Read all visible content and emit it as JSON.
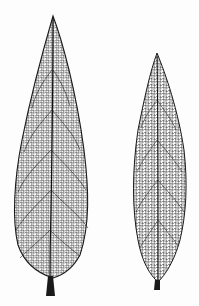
{
  "image": {
    "description": "Engraving-style illustration of two skeletonized lanceolate leaves showing reticulate venation",
    "background": "#fdfdfd",
    "ink": "#1a1a1a",
    "leaves": [
      {
        "name": "left-leaf",
        "shape": "lanceolate, broad",
        "tip": [
          53,
          16
        ],
        "base": [
          50,
          296
        ]
      },
      {
        "name": "right-leaf",
        "shape": "lanceolate, narrow",
        "tip": [
          157,
          53
        ],
        "base": [
          157,
          290
        ]
      }
    ]
  }
}
